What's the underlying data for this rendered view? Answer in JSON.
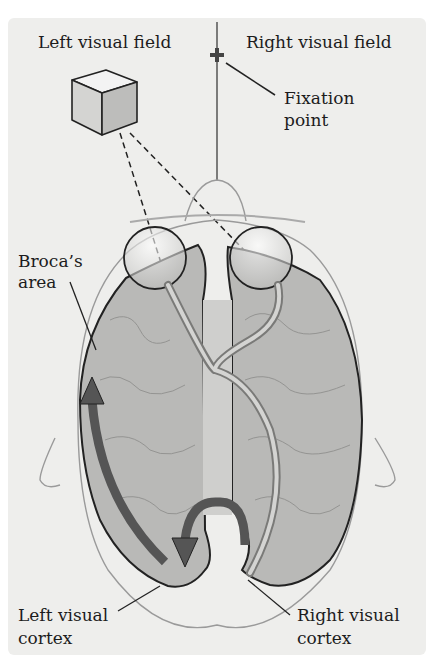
{
  "figure": {
    "labels": {
      "left_visual_field": "Left visual field",
      "right_visual_field": "Right visual field",
      "fixation_point_line1": "Fixation",
      "fixation_point_line2": "point",
      "broca_line1": "Broca’s",
      "broca_line2": "area",
      "left_cortex_line1": "Left visual",
      "left_cortex_line2": "cortex",
      "right_cortex_line1": "Right visual",
      "right_cortex_line2": "cortex"
    },
    "colors": {
      "background": "#eeeeec",
      "brain_fill": "#b9b9b7",
      "outline": "#222222",
      "head_outline": "#9a9a9a",
      "arrow": "#555555",
      "pathway": "#c8c8c6"
    }
  }
}
